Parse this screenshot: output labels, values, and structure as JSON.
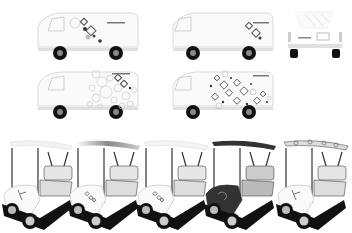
{
  "scene": {
    "description": "Vehicle livery design mockups",
    "vans": [
      {
        "id": "van-side-1",
        "view": "side",
        "pattern": "diagonal-circles-sparse",
        "brand_text": "ladyGOGO"
      },
      {
        "id": "van-side-2",
        "view": "side",
        "pattern": "diagonal-circles-minimal",
        "brand_text": "ladyGOGO"
      },
      {
        "id": "van-rear",
        "view": "rear",
        "brand_text": "ladyGOGO"
      },
      {
        "id": "van-side-3",
        "view": "side",
        "pattern": "circle-cluster",
        "brand_text": "ladyGOGO"
      },
      {
        "id": "van-side-4",
        "view": "side",
        "pattern": "dense-diamond-cluster",
        "brand_text": "ladyGOGO"
      }
    ],
    "golf_carts": [
      {
        "id": "cart-1",
        "roof": "white",
        "body": "white",
        "graphic": "golfer"
      },
      {
        "id": "cart-2",
        "roof": "gray-gradient",
        "body": "white",
        "graphic": "logo"
      },
      {
        "id": "cart-3",
        "roof": "white-pattern",
        "body": "white",
        "graphic": "logo"
      },
      {
        "id": "cart-4",
        "roof": "dark",
        "body": "dark",
        "graphic": "script-logo"
      },
      {
        "id": "cart-5",
        "roof": "floral-pattern",
        "body": "white",
        "graphic": "golfer"
      }
    ],
    "colors": {
      "background": "#ffffff",
      "outline": "#c8c8c8",
      "wheel": "#111111",
      "dark_body": "#333333",
      "accent": "#666666"
    }
  }
}
